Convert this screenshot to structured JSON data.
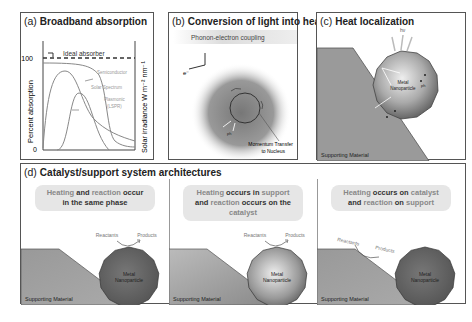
{
  "panels": {
    "a": {
      "label": "(a)",
      "title": "Broadband absorption",
      "ylabel_left": "Percent absorption",
      "ylabel_right": "Solar irradiance W m⁻² nm⁻¹",
      "tick_100": "100",
      "tick_0": "0",
      "ideal_label": "Ideal absorber",
      "curves": [
        "Semiconductor",
        "Solar Spectrum",
        "Plasmonic",
        "(LSPR)"
      ]
    },
    "b": {
      "label": "(b)",
      "title": "Conversion of light into heat",
      "banner": "Phonon-electron coupling",
      "electron": "e⁻",
      "annot1": "Momentum Transfer",
      "annot2": "to Nucleus",
      "ph": "ph"
    },
    "c": {
      "label": "(c)",
      "title": "Heat localization",
      "hv": "hν",
      "np1": "Metal",
      "np2": "Nanoparticle",
      "ph": "ph",
      "support": "Supporting Material"
    },
    "d": {
      "label": "(d)",
      "title": "Catalyst/support system architectures",
      "scenarios": [
        {
          "line1": [
            [
              "Heating",
              "lt"
            ],
            [
              " and ",
              ""
            ],
            [
              "reaction",
              "lt"
            ],
            [
              " occur",
              ""
            ]
          ],
          "line2": [
            [
              "in the same phase",
              ""
            ]
          ],
          "reactants": "Reactants",
          "products": "Products",
          "np1": "Metal",
          "np2": "Nanoparticle",
          "support": "Supporting Material"
        },
        {
          "line1": [
            [
              "Heating",
              "lt"
            ],
            [
              " occurs in ",
              ""
            ],
            [
              "support",
              "lt"
            ]
          ],
          "line2": [
            [
              "and ",
              ""
            ],
            [
              "reaction",
              "lt"
            ],
            [
              " occurs on the ",
              ""
            ],
            [
              "catalyst",
              "lt"
            ]
          ],
          "reactants": "Reactants",
          "products": "Products",
          "np1": "Metal",
          "np2": "Nanoparticle",
          "support": "Supporting Material"
        },
        {
          "line1": [
            [
              "Heating",
              "lt"
            ],
            [
              " occurs on ",
              ""
            ],
            [
              "catalyst",
              "lt"
            ]
          ],
          "line2": [
            [
              "and ",
              ""
            ],
            [
              "reaction",
              "lt"
            ],
            [
              " on ",
              ""
            ],
            [
              "support",
              "lt"
            ]
          ],
          "reactants": "Reactants",
          "products": "Products",
          "np1": "Metal",
          "np2": "Nanoparticle",
          "support": "Supporting Material"
        }
      ]
    }
  }
}
